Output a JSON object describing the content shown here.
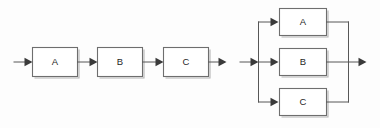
{
  "figure": {
    "background_color": "#fdfdfd",
    "line_color": "#575757",
    "box_stroke_color": "#6e6e6e",
    "box_shadow_color": "#b4b4b4",
    "box_fill_color": "#ffffff",
    "label_color": "#1f1f1f"
  },
  "diagrams": [
    {
      "id": "series",
      "name": "series-connection",
      "blocks": [
        {
          "label": "A"
        },
        {
          "label": "B"
        },
        {
          "label": "C"
        }
      ]
    },
    {
      "id": "parallel",
      "name": "parallel-connection",
      "blocks": [
        {
          "label": "A"
        },
        {
          "label": "B"
        },
        {
          "label": "C"
        }
      ]
    }
  ]
}
